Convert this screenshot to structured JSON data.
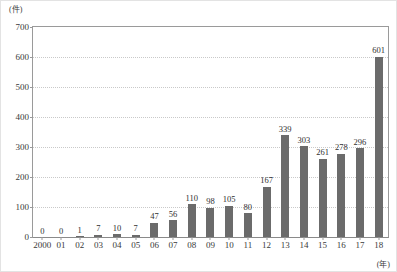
{
  "chart_data": {
    "type": "bar",
    "title": "",
    "xlabel": "(年)",
    "ylabel": "(件)",
    "categories": [
      "2000",
      "01",
      "02",
      "03",
      "04",
      "05",
      "06",
      "07",
      "08",
      "09",
      "10",
      "11",
      "12",
      "13",
      "14",
      "15",
      "16",
      "17",
      "18"
    ],
    "values": [
      0,
      0,
      1,
      7,
      10,
      7,
      47,
      56,
      110,
      98,
      105,
      80,
      167,
      339,
      303,
      261,
      278,
      296,
      601
    ],
    "value_labels": [
      "0",
      "0",
      "1",
      "7",
      "10",
      "7",
      "47",
      "56",
      "110",
      "98",
      "105",
      "80",
      "167",
      "339",
      "303",
      "261",
      "278",
      "296",
      "601"
    ],
    "ylim": [
      0,
      700
    ],
    "yticks": [
      0,
      100,
      200,
      300,
      400,
      500,
      600,
      700
    ],
    "ytick_labels": [
      "0",
      "100",
      "200",
      "300",
      "400",
      "500",
      "600",
      "700"
    ],
    "grid": true,
    "legend": "none",
    "bar_color": "#6b6b6b",
    "grid_color": "#c9c9c9",
    "axis_color": "#9a9a9a"
  }
}
